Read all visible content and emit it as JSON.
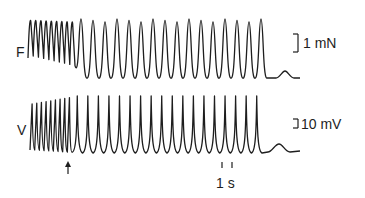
{
  "figure": {
    "traces": [
      {
        "id": "force",
        "label": "F",
        "scale_label": "1 mN"
      },
      {
        "id": "voltage",
        "label": "V",
        "scale_label": "10 mV"
      }
    ],
    "time_scale_label": "1 s",
    "stimulus_marker": "arrow-up",
    "colors": {
      "ink": "#1e1e1e",
      "background": "#ffffff"
    }
  },
  "chart_data": {
    "type": "line",
    "title": "",
    "series": [
      {
        "name": "F",
        "unit": "mN",
        "phase1_cycles": 9,
        "phase2_cycles": 16,
        "scale_bar": "1 mN"
      },
      {
        "name": "V",
        "unit": "mV",
        "phase1_spikes": 9,
        "phase2_spikes": 18,
        "scale_bar": "10 mV"
      }
    ],
    "time_scale_bar": "1 s",
    "annotations": [
      "↑ stimulus / transition marker"
    ]
  }
}
